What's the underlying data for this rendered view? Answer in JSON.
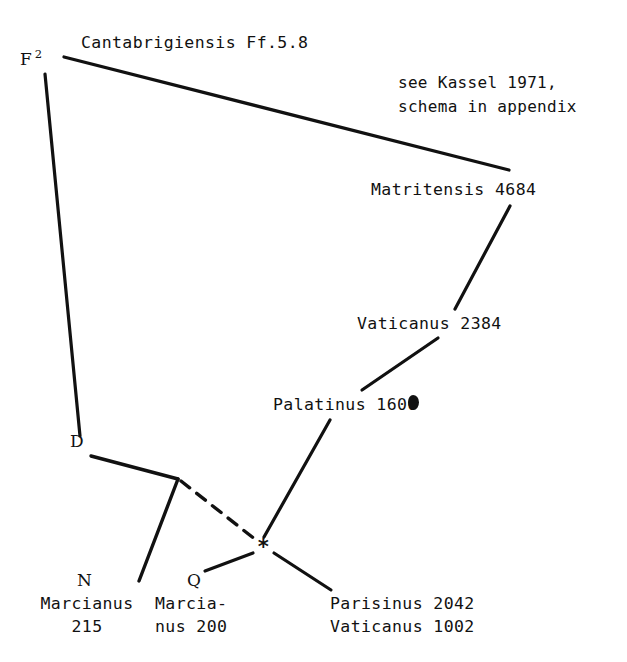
{
  "diagram": {
    "background_color": "#ffffff",
    "ink_color": "#111111"
  },
  "nodes": {
    "f2_sigil": "F",
    "f2_superscript": "2",
    "cantabrigiensis": "Cantabrigiensis Ff.5.8",
    "matritensis": "Matritensis 4684",
    "vaticanus_2384": "Vaticanus 2384",
    "palatinus": "Palatinus 1600",
    "d_sigil": "D",
    "n_sigil": "N",
    "q_sigil": "Q",
    "marcianus_215_line1": "Marcianus",
    "marcianus_215_line2": "215",
    "marcianus_200_line1": "Marcia-",
    "marcianus_200_line2": "nus 200",
    "parisinus": "Parisinus 2042",
    "vaticanus_1002": "Vaticanus 1002",
    "archetype_star": "*"
  },
  "annotations": {
    "kassel_line1": "see Kassel 1971,",
    "kassel_line2": "schema in appendix"
  },
  "edges": [
    {
      "name": "f2-to-cantabrigiensis-matritensis",
      "style": "solid"
    },
    {
      "name": "f2-to-d",
      "style": "solid"
    },
    {
      "name": "matritensis-to-vaticanus-2384",
      "style": "solid"
    },
    {
      "name": "vaticanus-2384-to-palatinus",
      "style": "solid"
    },
    {
      "name": "palatinus-to-archetype",
      "style": "solid"
    },
    {
      "name": "d-to-branch",
      "style": "solid"
    },
    {
      "name": "branch-to-marcianus-215",
      "style": "solid"
    },
    {
      "name": "branch-to-archetype",
      "style": "dashed"
    },
    {
      "name": "archetype-to-marcianus-200",
      "style": "solid"
    },
    {
      "name": "archetype-to-parisinus",
      "style": "solid"
    }
  ]
}
